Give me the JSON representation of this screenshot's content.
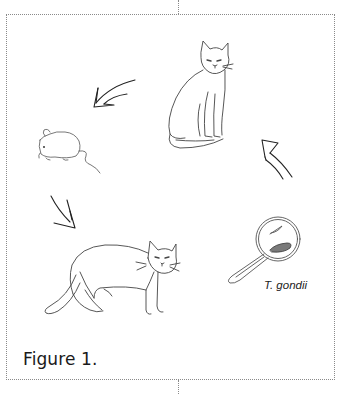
{
  "figure": {
    "caption": "Figure 1.",
    "organism_label": "T. gondii"
  },
  "nodes": [
    {
      "id": "cat-sitting",
      "label": "sitting cat"
    },
    {
      "id": "mouse",
      "label": "mouse"
    },
    {
      "id": "cat-standing",
      "label": "standing cat"
    },
    {
      "id": "magnifier",
      "label": "T. gondii"
    }
  ],
  "edges": [
    {
      "from": "cat-sitting",
      "to": "mouse",
      "direction": "down-left"
    },
    {
      "from": "mouse",
      "to": "cat-standing",
      "direction": "down-right"
    },
    {
      "from": "magnifier",
      "to": "cat-sitting",
      "direction": "up-left"
    }
  ],
  "colors": {
    "line": "#333333",
    "frame": "#8a8a8a",
    "background": "#ffffff"
  }
}
